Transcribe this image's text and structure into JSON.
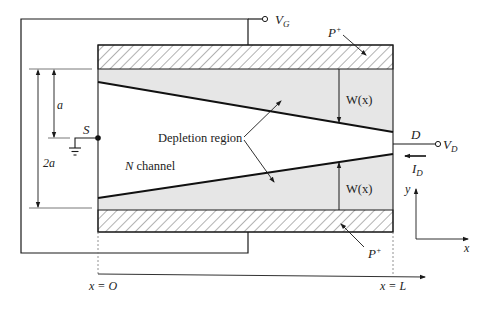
{
  "figure": {
    "type": "JFET cross-section schematic",
    "colors": {
      "line": "#1a1a1a",
      "depletion_fill": "#e6e6e6",
      "hatch": "#555555",
      "background": "#ffffff"
    }
  },
  "labels": {
    "gate_voltage": "V",
    "gate_voltage_sub": "G",
    "p_plus_top": "P",
    "p_plus_top_sup": "+",
    "p_plus_bottom": "P",
    "p_plus_bottom_sup": "+",
    "depletion_region": "Depletion region",
    "width_top": "W(x)",
    "width_bottom": "W(x)",
    "n_channel_italic": "N",
    "n_channel_rest": " channel",
    "source": "S",
    "drain": "D",
    "drain_voltage": "V",
    "drain_voltage_sub": "D",
    "drain_current": "I",
    "drain_current_sub": "D",
    "half_height": "a",
    "full_height": "2a",
    "axis_y": "y",
    "axis_x": "x",
    "x_start": "x = O",
    "x_end": "x = L"
  }
}
